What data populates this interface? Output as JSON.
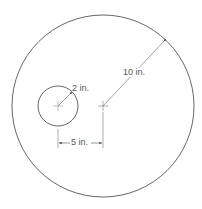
{
  "diagram": {
    "type": "geometry-figure",
    "stroke_color": "#555555",
    "large_circle": {
      "center": [
        103,
        106
      ],
      "radius": 91,
      "radius_label": "10 in."
    },
    "small_circle": {
      "center": [
        58,
        106
      ],
      "radius": 20,
      "radius_label": "2 in."
    },
    "center_distance": {
      "label": "5 in."
    }
  }
}
